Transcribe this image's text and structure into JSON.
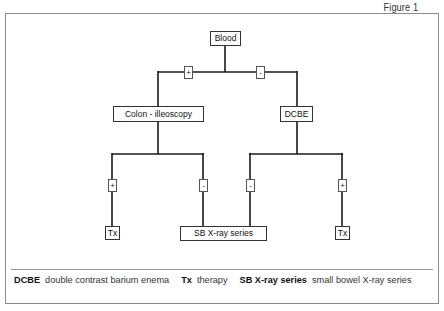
{
  "figure": {
    "label": "Figure 1"
  },
  "diagram": {
    "nodes": {
      "root": "Blood",
      "colon": "Colon - illeoscopy",
      "dcbe": "DCBE",
      "tx_left": "Tx",
      "sb_xray": "SB X-ray series",
      "tx_right": "Tx"
    },
    "edges": {
      "blood_to_colon": "+",
      "blood_to_dcbe": "-",
      "colon_to_tx": "+",
      "colon_to_sb": "-",
      "dcbe_to_sb": "-",
      "dcbe_to_tx": "+"
    }
  },
  "legend": {
    "items": [
      {
        "term": "DCBE",
        "definition": "double contrast barium enema"
      },
      {
        "term": "Tx",
        "definition": "therapy"
      },
      {
        "term": "SB X-ray series",
        "definition": "small bowel X-ray series"
      }
    ]
  }
}
